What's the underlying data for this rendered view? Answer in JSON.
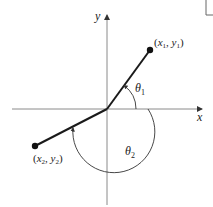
{
  "diagram": {
    "axes": {
      "x_label": "x",
      "y_label": "y"
    },
    "points": [
      {
        "id": "p1",
        "label_open": "(",
        "x_sym": "x",
        "x_sub": "1",
        "sep": ", ",
        "y_sym": "y",
        "y_sub": "1",
        "label_close": ")"
      },
      {
        "id": "p2",
        "label_open": "(",
        "x_sym": "x",
        "x_sub": "2",
        "sep": ", ",
        "y_sym": "y",
        "y_sub": "2",
        "label_close": ")"
      }
    ],
    "angles": [
      {
        "id": "theta1",
        "sym": "θ",
        "sub": "1"
      },
      {
        "id": "theta2",
        "sym": "θ",
        "sub": "2"
      }
    ],
    "colors": {
      "axis": "#8a8a8a",
      "segment": "#1a1a1a",
      "arc": "#333333",
      "text": "#222222"
    }
  }
}
